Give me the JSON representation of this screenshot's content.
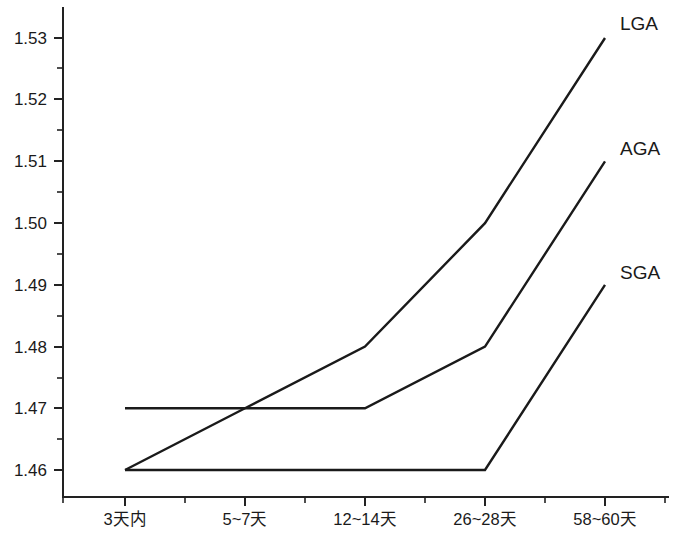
{
  "chart_data": {
    "type": "line",
    "title": "",
    "subtitle": "",
    "xlabel": "",
    "ylabel": "",
    "categories": [
      "3天内",
      "5~7天",
      "12~14天",
      "26~28天",
      "58~60天"
    ],
    "series": [
      {
        "name": "LGA",
        "values": [
          1.46,
          1.47,
          1.48,
          1.5,
          1.53
        ]
      },
      {
        "name": "AGA",
        "values": [
          1.47,
          1.47,
          1.47,
          1.48,
          1.51
        ]
      },
      {
        "name": "SGA",
        "values": [
          1.46,
          1.46,
          1.46,
          1.46,
          1.49
        ]
      }
    ],
    "ylim": [
      1.455,
      1.535
    ],
    "ytick_labels": [
      "1.46",
      "1.47",
      "1.48",
      "1.49",
      "1.50",
      "1.51",
      "1.52",
      "1.53"
    ],
    "ytick_values": [
      1.46,
      1.47,
      1.48,
      1.49,
      1.5,
      1.51,
      1.52,
      1.53
    ],
    "minor_ticks": true,
    "grid": false,
    "legend_position": "right-inline",
    "line_color": "#1a1a1a",
    "axis_color": "#222222",
    "background_color": "#ffffff"
  },
  "axes": {
    "y_labels": {
      "t1_46": "1.46",
      "t1_47": "1.47",
      "t1_48": "1.48",
      "t1_49": "1.49",
      "t1_50": "1.50",
      "t1_51": "1.51",
      "t1_52": "1.52",
      "t1_53": "1.53"
    },
    "x_labels": {
      "c0": "3天内",
      "c1": "5~7天",
      "c2": "12~14天",
      "c3": "26~28天",
      "c4": "58~60天"
    }
  },
  "series_labels": {
    "lga": "LGA",
    "aga": "AGA",
    "sga": "SGA"
  }
}
